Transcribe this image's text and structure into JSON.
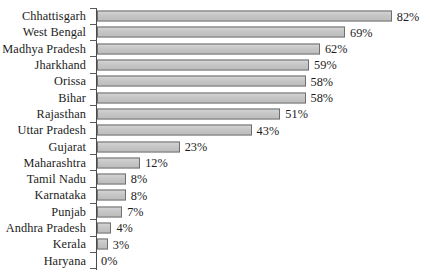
{
  "chart_data": {
    "type": "bar",
    "orientation": "horizontal",
    "title": "",
    "subtitle": "",
    "xlabel": "",
    "ylabel": "",
    "xlim": [
      0,
      90
    ],
    "grid": false,
    "legend": null,
    "value_suffix": "%",
    "categories": [
      "Chhattisgarh",
      "West Bengal",
      "Madhya Pradesh",
      "Jharkhand",
      "Orissa",
      "Bihar",
      "Rajasthan",
      "Uttar Pradesh",
      "Gujarat",
      "Maharashtra",
      "Tamil Nadu",
      "Karnataka",
      "Punjab",
      "Andhra Pradesh",
      "Kerala",
      "Haryana"
    ],
    "values": [
      82,
      69,
      62,
      59,
      58,
      58,
      51,
      43,
      23,
      12,
      8,
      8,
      7,
      4,
      3,
      0
    ],
    "data_labels": [
      "82%",
      "69%",
      "62%",
      "59%",
      "58%",
      "58%",
      "51%",
      "43%",
      "23%",
      "12%",
      "8%",
      "8%",
      "7%",
      "4%",
      "3%",
      "0%"
    ],
    "colors": {
      "bar_fill": "#c9c9c9",
      "bar_border": "#6f6f6f",
      "axis": "#4a4a4a",
      "text": "#1c1c1c",
      "background": "#ffffff"
    }
  },
  "rows": [
    {
      "label": "Chhattisgarh",
      "value": 82,
      "data_label": "82%"
    },
    {
      "label": "West Bengal",
      "value": 69,
      "data_label": "69%"
    },
    {
      "label": "Madhya Pradesh",
      "value": 62,
      "data_label": "62%"
    },
    {
      "label": "Jharkhand",
      "value": 59,
      "data_label": "59%"
    },
    {
      "label": "Orissa",
      "value": 58,
      "data_label": "58%"
    },
    {
      "label": "Bihar",
      "value": 58,
      "data_label": "58%"
    },
    {
      "label": "Rajasthan",
      "value": 51,
      "data_label": "51%"
    },
    {
      "label": "Uttar Pradesh",
      "value": 43,
      "data_label": "43%"
    },
    {
      "label": "Gujarat",
      "value": 23,
      "data_label": "23%"
    },
    {
      "label": "Maharashtra",
      "value": 12,
      "data_label": "12%"
    },
    {
      "label": "Tamil Nadu",
      "value": 8,
      "data_label": "8%"
    },
    {
      "label": "Karnataka",
      "value": 8,
      "data_label": "8%"
    },
    {
      "label": "Punjab",
      "value": 7,
      "data_label": "7%"
    },
    {
      "label": "Andhra Pradesh",
      "value": 4,
      "data_label": "4%"
    },
    {
      "label": "Kerala",
      "value": 3,
      "data_label": "3%"
    },
    {
      "label": "Haryana",
      "value": 0,
      "data_label": "0%"
    }
  ],
  "scale": {
    "px_per_unit": 3.595
  }
}
